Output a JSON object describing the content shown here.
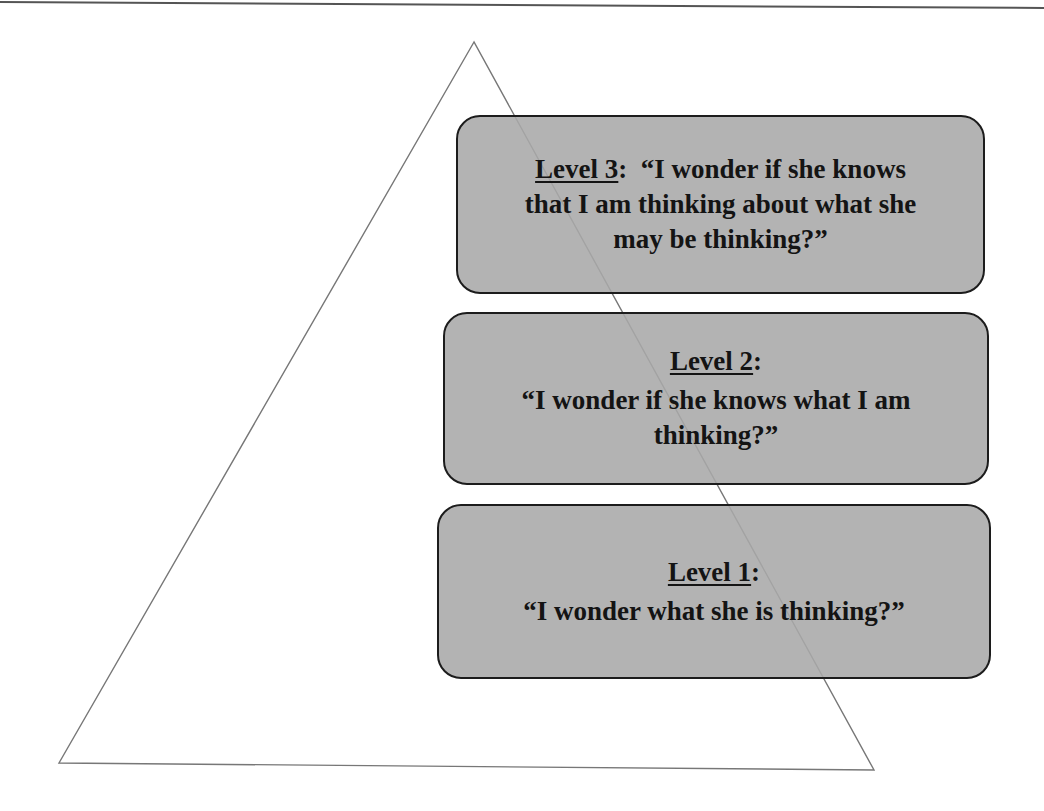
{
  "diagram": {
    "type": "pyramid",
    "colors": {
      "background": "#ffffff",
      "triangle_stroke": "#777777",
      "box_fill": "#a8a8a8",
      "box_border": "#1c1c1c",
      "text": "#141414",
      "top_rule": "#555555"
    },
    "levels": [
      {
        "id": "level-3",
        "label": "Level 3",
        "colon": ":",
        "lines": [
          "“I wonder if she knows",
          "that I am thinking about what she",
          "may be thinking?”"
        ]
      },
      {
        "id": "level-2",
        "label": "Level 2",
        "colon": ":",
        "lines": [
          "“I wonder if she knows what I am",
          "thinking?”"
        ]
      },
      {
        "id": "level-1",
        "label": "Level 1",
        "colon": ":",
        "lines": [
          "“I wonder what she is thinking?”"
        ]
      }
    ]
  }
}
